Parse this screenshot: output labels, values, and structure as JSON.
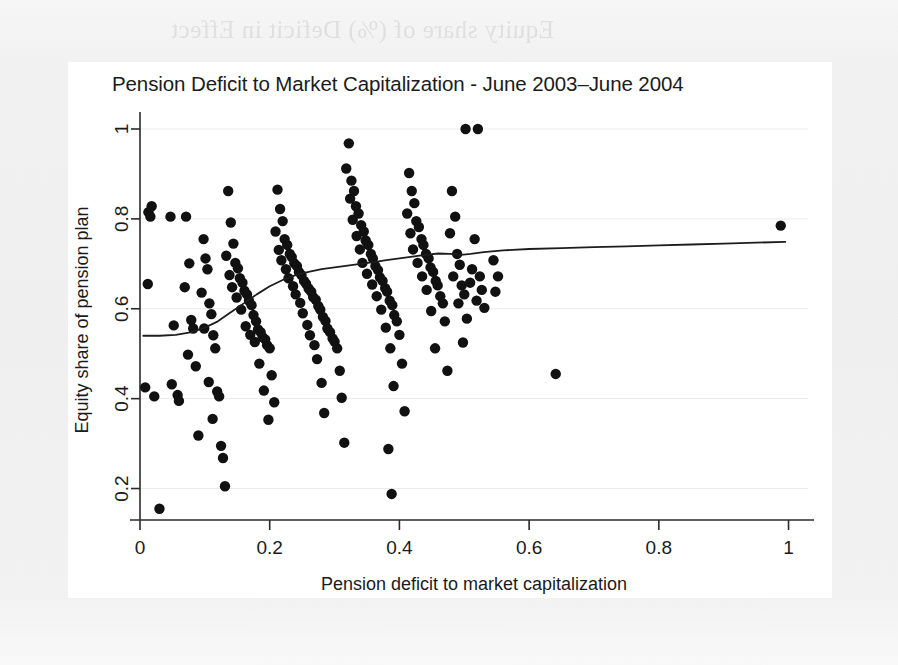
{
  "page": {
    "background_color": "#f1f1f1",
    "panel_color": "#ffffff",
    "ghost_text": "Equity share of (%) Deficit in Effect"
  },
  "chart_data": {
    "type": "scatter",
    "title": "Pension Deficit to Market Capitalization - June 2003–June 2004",
    "xlabel": "Pension deficit to market capitalization",
    "ylabel": "Equity share of pension plan",
    "xlim": [
      0,
      1.03
    ],
    "ylim": [
      0.13,
      1.02
    ],
    "xticks": [
      0,
      0.2,
      0.4,
      0.6,
      0.8,
      1
    ],
    "xticklabels": [
      "0",
      "0.2",
      "0.4",
      "0.6",
      "0.8",
      "1"
    ],
    "yticks": [
      0.2,
      0.4,
      0.6,
      0.8,
      1
    ],
    "yticklabels": [
      "0.2",
      "0.4",
      "0.6",
      "0.8",
      "1"
    ],
    "grid": false,
    "marker_color": "#111111",
    "marker_radius_px": 5.2,
    "legend": null,
    "series": [
      {
        "name": "Companies",
        "type": "scatter",
        "points": [
          [
            0.013,
            0.815
          ],
          [
            0.016,
            0.805
          ],
          [
            0.018,
            0.828
          ],
          [
            0.012,
            0.655
          ],
          [
            0.008,
            0.425
          ],
          [
            0.022,
            0.405
          ],
          [
            0.03,
            0.155
          ],
          [
            0.047,
            0.805
          ],
          [
            0.052,
            0.563
          ],
          [
            0.049,
            0.432
          ],
          [
            0.058,
            0.408
          ],
          [
            0.06,
            0.395
          ],
          [
            0.071,
            0.805
          ],
          [
            0.076,
            0.701
          ],
          [
            0.069,
            0.648
          ],
          [
            0.079,
            0.575
          ],
          [
            0.082,
            0.556
          ],
          [
            0.074,
            0.498
          ],
          [
            0.086,
            0.472
          ],
          [
            0.09,
            0.318
          ],
          [
            0.098,
            0.755
          ],
          [
            0.101,
            0.712
          ],
          [
            0.104,
            0.688
          ],
          [
            0.095,
            0.636
          ],
          [
            0.107,
            0.612
          ],
          [
            0.11,
            0.588
          ],
          [
            0.099,
            0.556
          ],
          [
            0.113,
            0.541
          ],
          [
            0.116,
            0.512
          ],
          [
            0.106,
            0.437
          ],
          [
            0.119,
            0.416
          ],
          [
            0.122,
            0.405
          ],
          [
            0.112,
            0.355
          ],
          [
            0.125,
            0.295
          ],
          [
            0.128,
            0.268
          ],
          [
            0.131,
            0.205
          ],
          [
            0.136,
            0.862
          ],
          [
            0.14,
            0.792
          ],
          [
            0.144,
            0.745
          ],
          [
            0.133,
            0.718
          ],
          [
            0.147,
            0.702
          ],
          [
            0.151,
            0.69
          ],
          [
            0.138,
            0.675
          ],
          [
            0.154,
            0.668
          ],
          [
            0.158,
            0.658
          ],
          [
            0.142,
            0.648
          ],
          [
            0.161,
            0.64
          ],
          [
            0.165,
            0.632
          ],
          [
            0.149,
            0.625
          ],
          [
            0.168,
            0.618
          ],
          [
            0.172,
            0.608
          ],
          [
            0.156,
            0.598
          ],
          [
            0.175,
            0.586
          ],
          [
            0.179,
            0.572
          ],
          [
            0.163,
            0.561
          ],
          [
            0.182,
            0.554
          ],
          [
            0.186,
            0.548
          ],
          [
            0.17,
            0.542
          ],
          [
            0.189,
            0.537
          ],
          [
            0.193,
            0.532
          ],
          [
            0.177,
            0.526
          ],
          [
            0.196,
            0.519
          ],
          [
            0.2,
            0.512
          ],
          [
            0.184,
            0.478
          ],
          [
            0.203,
            0.452
          ],
          [
            0.191,
            0.418
          ],
          [
            0.207,
            0.392
          ],
          [
            0.198,
            0.353
          ],
          [
            0.212,
            0.865
          ],
          [
            0.216,
            0.822
          ],
          [
            0.22,
            0.795
          ],
          [
            0.209,
            0.772
          ],
          [
            0.223,
            0.755
          ],
          [
            0.227,
            0.742
          ],
          [
            0.214,
            0.731
          ],
          [
            0.231,
            0.722
          ],
          [
            0.234,
            0.715
          ],
          [
            0.218,
            0.708
          ],
          [
            0.238,
            0.701
          ],
          [
            0.242,
            0.695
          ],
          [
            0.225,
            0.688
          ],
          [
            0.245,
            0.682
          ],
          [
            0.249,
            0.675
          ],
          [
            0.229,
            0.668
          ],
          [
            0.253,
            0.662
          ],
          [
            0.256,
            0.656
          ],
          [
            0.236,
            0.65
          ],
          [
            0.26,
            0.645
          ],
          [
            0.264,
            0.638
          ],
          [
            0.24,
            0.632
          ],
          [
            0.267,
            0.626
          ],
          [
            0.271,
            0.62
          ],
          [
            0.247,
            0.613
          ],
          [
            0.275,
            0.606
          ],
          [
            0.278,
            0.598
          ],
          [
            0.251,
            0.59
          ],
          [
            0.282,
            0.582
          ],
          [
            0.286,
            0.573
          ],
          [
            0.258,
            0.564
          ],
          [
            0.289,
            0.556
          ],
          [
            0.293,
            0.548
          ],
          [
            0.262,
            0.541
          ],
          [
            0.297,
            0.534
          ],
          [
            0.3,
            0.527
          ],
          [
            0.269,
            0.519
          ],
          [
            0.304,
            0.512
          ],
          [
            0.273,
            0.488
          ],
          [
            0.308,
            0.462
          ],
          [
            0.28,
            0.435
          ],
          [
            0.311,
            0.402
          ],
          [
            0.284,
            0.368
          ],
          [
            0.315,
            0.302
          ],
          [
            0.322,
            0.968
          ],
          [
            0.318,
            0.912
          ],
          [
            0.326,
            0.885
          ],
          [
            0.33,
            0.862
          ],
          [
            0.324,
            0.845
          ],
          [
            0.333,
            0.828
          ],
          [
            0.337,
            0.812
          ],
          [
            0.328,
            0.798
          ],
          [
            0.341,
            0.786
          ],
          [
            0.345,
            0.772
          ],
          [
            0.334,
            0.762
          ],
          [
            0.348,
            0.752
          ],
          [
            0.352,
            0.742
          ],
          [
            0.339,
            0.732
          ],
          [
            0.356,
            0.722
          ],
          [
            0.359,
            0.712
          ],
          [
            0.343,
            0.702
          ],
          [
            0.363,
            0.695
          ],
          [
            0.367,
            0.686
          ],
          [
            0.35,
            0.678
          ],
          [
            0.37,
            0.67
          ],
          [
            0.374,
            0.662
          ],
          [
            0.358,
            0.654
          ],
          [
            0.378,
            0.646
          ],
          [
            0.381,
            0.638
          ],
          [
            0.365,
            0.628
          ],
          [
            0.385,
            0.618
          ],
          [
            0.389,
            0.608
          ],
          [
            0.372,
            0.598
          ],
          [
            0.392,
            0.586
          ],
          [
            0.396,
            0.572
          ],
          [
            0.379,
            0.558
          ],
          [
            0.4,
            0.542
          ],
          [
            0.386,
            0.512
          ],
          [
            0.404,
            0.478
          ],
          [
            0.391,
            0.428
          ],
          [
            0.408,
            0.372
          ],
          [
            0.383,
            0.288
          ],
          [
            0.388,
            0.188
          ],
          [
            0.415,
            0.902
          ],
          [
            0.419,
            0.862
          ],
          [
            0.423,
            0.835
          ],
          [
            0.412,
            0.812
          ],
          [
            0.426,
            0.795
          ],
          [
            0.43,
            0.782
          ],
          [
            0.417,
            0.768
          ],
          [
            0.434,
            0.755
          ],
          [
            0.437,
            0.742
          ],
          [
            0.421,
            0.732
          ],
          [
            0.441,
            0.722
          ],
          [
            0.445,
            0.712
          ],
          [
            0.428,
            0.702
          ],
          [
            0.448,
            0.692
          ],
          [
            0.452,
            0.682
          ],
          [
            0.435,
            0.672
          ],
          [
            0.456,
            0.662
          ],
          [
            0.459,
            0.652
          ],
          [
            0.442,
            0.642
          ],
          [
            0.463,
            0.628
          ],
          [
            0.467,
            0.612
          ],
          [
            0.449,
            0.595
          ],
          [
            0.47,
            0.572
          ],
          [
            0.455,
            0.512
          ],
          [
            0.474,
            0.462
          ],
          [
            0.481,
            0.862
          ],
          [
            0.486,
            0.805
          ],
          [
            0.478,
            0.768
          ],
          [
            0.489,
            0.722
          ],
          [
            0.493,
            0.698
          ],
          [
            0.483,
            0.672
          ],
          [
            0.496,
            0.652
          ],
          [
            0.5,
            0.632
          ],
          [
            0.491,
            0.612
          ],
          [
            0.504,
            0.578
          ],
          [
            0.498,
            0.525
          ],
          [
            0.502,
            1.0
          ],
          [
            0.521,
            1.0
          ],
          [
            0.516,
            0.755
          ],
          [
            0.512,
            0.688
          ],
          [
            0.524,
            0.672
          ],
          [
            0.509,
            0.658
          ],
          [
            0.527,
            0.642
          ],
          [
            0.519,
            0.618
          ],
          [
            0.531,
            0.602
          ],
          [
            0.545,
            0.708
          ],
          [
            0.552,
            0.672
          ],
          [
            0.548,
            0.638
          ],
          [
            0.641,
            0.455
          ],
          [
            0.988,
            0.785
          ]
        ]
      }
    ],
    "fit_line": {
      "name": "lowess smoother",
      "type": "line",
      "color": "#1d1d1d",
      "points": [
        [
          0.005,
          0.54
        ],
        [
          0.03,
          0.54
        ],
        [
          0.055,
          0.542
        ],
        [
          0.08,
          0.548
        ],
        [
          0.1,
          0.558
        ],
        [
          0.12,
          0.572
        ],
        [
          0.14,
          0.592
        ],
        [
          0.16,
          0.612
        ],
        [
          0.18,
          0.632
        ],
        [
          0.2,
          0.65
        ],
        [
          0.22,
          0.664
        ],
        [
          0.24,
          0.675
        ],
        [
          0.26,
          0.682
        ],
        [
          0.28,
          0.688
        ],
        [
          0.3,
          0.692
        ],
        [
          0.32,
          0.696
        ],
        [
          0.34,
          0.7
        ],
        [
          0.36,
          0.704
        ],
        [
          0.38,
          0.708
        ],
        [
          0.4,
          0.712
        ],
        [
          0.42,
          0.716
        ],
        [
          0.44,
          0.72
        ],
        [
          0.46,
          0.723
        ],
        [
          0.478,
          0.722
        ],
        [
          0.495,
          0.72
        ],
        [
          0.51,
          0.722
        ],
        [
          0.53,
          0.726
        ],
        [
          0.56,
          0.73
        ],
        [
          0.6,
          0.733
        ],
        [
          0.65,
          0.735
        ],
        [
          0.7,
          0.737
        ],
        [
          0.75,
          0.739
        ],
        [
          0.8,
          0.741
        ],
        [
          0.85,
          0.743
        ],
        [
          0.9,
          0.745
        ],
        [
          0.95,
          0.747
        ],
        [
          0.995,
          0.749
        ]
      ]
    }
  }
}
